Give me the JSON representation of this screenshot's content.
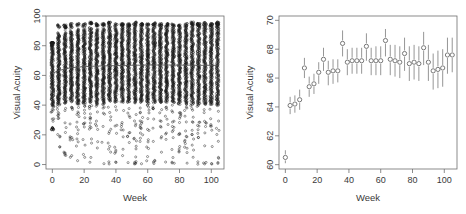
{
  "figure": {
    "background_color": "#ffffff",
    "panel_count": 2
  },
  "chart_data": [
    {
      "type": "scatter",
      "panel": "left",
      "title": "",
      "xlabel": "Week",
      "ylabel": "Visual Acuity",
      "xlim": [
        -4,
        108
      ],
      "ylim": [
        -3,
        100
      ],
      "xticks": [
        0,
        20,
        40,
        60,
        80,
        100
      ],
      "yticks": [
        0,
        20,
        40,
        60,
        80,
        100
      ],
      "xtick_labels": [
        "0",
        "20",
        "40",
        "60",
        "80",
        "100"
      ],
      "ytick_labels": [
        "0",
        "20",
        "40",
        "60",
        "80",
        "100"
      ],
      "grid": false,
      "legend": "none",
      "marker": "open-circle",
      "description": "Raw visual acuity observations for all subjects plotted at each scheduled visit week; dense vertical columns span roughly 0 to 95 letters with a smooth trend line near 63-67.",
      "visit_weeks": [
        0,
        4,
        8,
        12,
        16,
        20,
        24,
        28,
        32,
        36,
        40,
        44,
        48,
        52,
        56,
        60,
        64,
        68,
        72,
        76,
        80,
        84,
        88,
        92,
        96,
        100,
        104
      ],
      "columns": [
        {
          "week": 0,
          "n": 1100,
          "min": 23,
          "max": 82,
          "q1": 55,
          "median": 63,
          "q3": 72
        },
        {
          "week": 4,
          "n": 1090,
          "min": 10,
          "max": 94,
          "q1": 56,
          "median": 64,
          "q3": 73
        },
        {
          "week": 8,
          "n": 1080,
          "min": 6,
          "max": 94,
          "q1": 57,
          "median": 65,
          "q3": 74
        },
        {
          "week": 12,
          "n": 1070,
          "min": 4,
          "max": 95,
          "q1": 58,
          "median": 66,
          "q3": 75
        },
        {
          "week": 16,
          "n": 1060,
          "min": 2,
          "max": 95,
          "q1": 57,
          "median": 66,
          "q3": 75
        },
        {
          "week": 20,
          "n": 1050,
          "min": 1,
          "max": 95,
          "q1": 57,
          "median": 66,
          "q3": 75
        },
        {
          "week": 24,
          "n": 1040,
          "min": 0,
          "max": 96,
          "q1": 58,
          "median": 67,
          "q3": 76
        },
        {
          "week": 28,
          "n": 1030,
          "min": 0,
          "max": 95,
          "q1": 58,
          "median": 66,
          "q3": 76
        },
        {
          "week": 32,
          "n": 1020,
          "min": 0,
          "max": 95,
          "q1": 58,
          "median": 66,
          "q3": 76
        },
        {
          "week": 36,
          "n": 1010,
          "min": 0,
          "max": 96,
          "q1": 58,
          "median": 68,
          "q3": 76
        },
        {
          "week": 40,
          "n": 1000,
          "min": 0,
          "max": 95,
          "q1": 58,
          "median": 67,
          "q3": 76
        },
        {
          "week": 44,
          "n": 990,
          "min": 0,
          "max": 95,
          "q1": 58,
          "median": 67,
          "q3": 76
        },
        {
          "week": 48,
          "n": 980,
          "min": 0,
          "max": 95,
          "q1": 58,
          "median": 67,
          "q3": 76
        },
        {
          "week": 52,
          "n": 970,
          "min": 0,
          "max": 96,
          "q1": 58,
          "median": 68,
          "q3": 77
        },
        {
          "week": 56,
          "n": 960,
          "min": 0,
          "max": 95,
          "q1": 58,
          "median": 67,
          "q3": 76
        },
        {
          "week": 60,
          "n": 950,
          "min": 0,
          "max": 95,
          "q1": 58,
          "median": 67,
          "q3": 76
        },
        {
          "week": 64,
          "n": 940,
          "min": 0,
          "max": 96,
          "q1": 58,
          "median": 68,
          "q3": 77
        },
        {
          "week": 68,
          "n": 930,
          "min": 0,
          "max": 95,
          "q1": 58,
          "median": 67,
          "q3": 76
        },
        {
          "week": 72,
          "n": 920,
          "min": 0,
          "max": 95,
          "q1": 58,
          "median": 67,
          "q3": 76
        },
        {
          "week": 76,
          "n": 910,
          "min": 0,
          "max": 95,
          "q1": 58,
          "median": 67,
          "q3": 76
        },
        {
          "week": 80,
          "n": 900,
          "min": 0,
          "max": 95,
          "q1": 57,
          "median": 67,
          "q3": 76
        },
        {
          "week": 84,
          "n": 890,
          "min": 0,
          "max": 95,
          "q1": 57,
          "median": 67,
          "q3": 76
        },
        {
          "week": 88,
          "n": 880,
          "min": 0,
          "max": 96,
          "q1": 58,
          "median": 68,
          "q3": 77
        },
        {
          "week": 92,
          "n": 870,
          "min": 0,
          "max": 95,
          "q1": 57,
          "median": 67,
          "q3": 76
        },
        {
          "week": 96,
          "n": 860,
          "min": 0,
          "max": 96,
          "q1": 57,
          "median": 67,
          "q3": 76
        },
        {
          "week": 100,
          "n": 850,
          "min": 0,
          "max": 95,
          "q1": 57,
          "median": 67,
          "q3": 76
        },
        {
          "week": 104,
          "n": 840,
          "min": 0,
          "max": 96,
          "q1": 57,
          "median": 68,
          "q3": 77
        }
      ],
      "trend_line": {
        "name": "smoothed mean",
        "x": [
          0,
          4,
          8,
          12,
          16,
          20,
          24,
          28,
          32,
          36,
          40,
          44,
          48,
          52,
          56,
          60,
          64,
          68,
          72,
          76,
          80,
          84,
          88,
          92,
          96,
          100,
          104
        ],
        "y": [
          61.5,
          63.2,
          64.4,
          65.2,
          65.6,
          65.9,
          66.1,
          66.3,
          66.4,
          66.5,
          66.6,
          66.7,
          66.8,
          66.9,
          66.9,
          67.0,
          67.0,
          67.0,
          67.0,
          67.0,
          66.9,
          66.9,
          66.9,
          66.8,
          66.8,
          66.8,
          66.8
        ]
      }
    },
    {
      "type": "scatter",
      "panel": "right",
      "title": "",
      "xlabel": "Week",
      "ylabel": "Visual Acuity",
      "xlim": [
        -4,
        108
      ],
      "ylim": [
        59.7,
        70.3
      ],
      "xticks": [
        0,
        20,
        40,
        60,
        80,
        100
      ],
      "yticks": [
        60,
        62,
        64,
        66,
        68,
        70
      ],
      "xtick_labels": [
        "0",
        "20",
        "40",
        "60",
        "80",
        "100"
      ],
      "ytick_labels": [
        "60",
        "62",
        "64",
        "66",
        "68",
        "70"
      ],
      "grid": false,
      "legend": "none",
      "marker": "open-circle-with-error-bars",
      "description": "Mean visual acuity by visit week with vertical confidence interval bars; rises steeply from about 60.5 at week 0 to roughly 67 by week 40, then plateaus between 66.5 and 68.5 through week 104.",
      "series": [
        {
          "name": "mean visual acuity",
          "x": [
            0,
            3,
            6,
            9,
            12,
            15,
            18,
            21,
            24,
            27,
            30,
            33,
            36,
            39,
            42,
            45,
            48,
            51,
            54,
            57,
            60,
            63,
            66,
            69,
            72,
            75,
            78,
            81,
            84,
            87,
            90,
            93,
            96,
            99,
            102,
            105
          ],
          "values": [
            60.5,
            64.1,
            64.2,
            64.5,
            66.7,
            65.4,
            65.6,
            66.4,
            67.3,
            66.4,
            66.5,
            66.5,
            68.4,
            67.1,
            67.2,
            67.2,
            67.2,
            68.2,
            67.2,
            67.2,
            67.2,
            68.6,
            67.3,
            67.2,
            67.1,
            67.7,
            67.0,
            67.1,
            67.0,
            68.1,
            67.1,
            66.5,
            66.6,
            66.7,
            67.6,
            67.6
          ],
          "lower": [
            60.1,
            63.5,
            63.6,
            63.8,
            66.0,
            64.7,
            64.9,
            65.6,
            66.5,
            65.5,
            65.6,
            65.7,
            67.5,
            66.2,
            66.3,
            66.3,
            66.3,
            67.2,
            66.2,
            66.2,
            66.2,
            67.5,
            66.2,
            66.1,
            66.0,
            66.5,
            65.8,
            65.9,
            65.8,
            66.9,
            65.8,
            65.2,
            65.3,
            65.4,
            66.3,
            66.4
          ],
          "upper": [
            61.0,
            64.7,
            64.8,
            65.2,
            67.4,
            66.1,
            66.3,
            67.1,
            68.1,
            67.2,
            67.3,
            67.3,
            69.3,
            68.0,
            68.1,
            68.1,
            68.1,
            69.1,
            68.1,
            68.2,
            68.2,
            69.4,
            68.3,
            68.3,
            68.2,
            68.8,
            68.2,
            68.3,
            68.2,
            69.2,
            68.3,
            67.7,
            67.9,
            68.0,
            68.8,
            68.8
          ]
        }
      ]
    }
  ]
}
